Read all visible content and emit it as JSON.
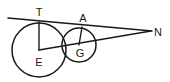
{
  "figure": {
    "background_color": "#ffffff",
    "stroke_color": "#1a1a1a",
    "width": 170,
    "height": 82,
    "points": {
      "T": {
        "label": "T",
        "x": 39,
        "y": 22,
        "label_x": 39,
        "label_y": 16
      },
      "A": {
        "label": "A",
        "x": 82,
        "y": 27,
        "label_x": 83,
        "label_y": 22
      },
      "N": {
        "label": "N",
        "x": 150,
        "y": 31,
        "label_x": 158,
        "label_y": 36
      },
      "E": {
        "label": "E",
        "x": 39,
        "y": 50,
        "label_x": 39,
        "label_y": 66
      },
      "G": {
        "label": "G",
        "x": 79,
        "y": 45,
        "label_x": 80,
        "label_y": 57
      }
    },
    "circles": [
      {
        "name": "circle-E",
        "center_label": "E",
        "cx": 39,
        "cy": 50,
        "r": 27
      },
      {
        "name": "circle-G",
        "center_label": "G",
        "cx": 79,
        "cy": 45,
        "r": 17
      }
    ],
    "segments": [
      {
        "name": "tangent-line-TAN",
        "from": "tangent-start",
        "to": "N",
        "x1": 8,
        "y1": 18,
        "x2": 152,
        "y2": 31
      },
      {
        "name": "radius-ET",
        "from": "E",
        "to": "T",
        "x1": 39,
        "y1": 50,
        "x2": 39,
        "y2": 22
      },
      {
        "name": "radius-GA",
        "from": "G",
        "to": "A",
        "x1": 79,
        "y1": 45,
        "x2": 82,
        "y2": 27
      },
      {
        "name": "centerline-EGN",
        "from": "E",
        "to": "N",
        "x1": 39,
        "y1": 50,
        "x2": 151,
        "y2": 31
      }
    ]
  }
}
